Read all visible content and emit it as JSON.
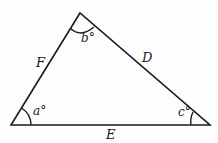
{
  "diagram": {
    "type": "triangle",
    "colors": {
      "stroke": "#1a1a1a",
      "background": "#fdfdfd"
    },
    "sides": {
      "left": "F",
      "right": "D",
      "bottom": "E"
    },
    "angles": {
      "bottom_left": "a°",
      "top": "b°",
      "bottom_right": "c°"
    }
  }
}
